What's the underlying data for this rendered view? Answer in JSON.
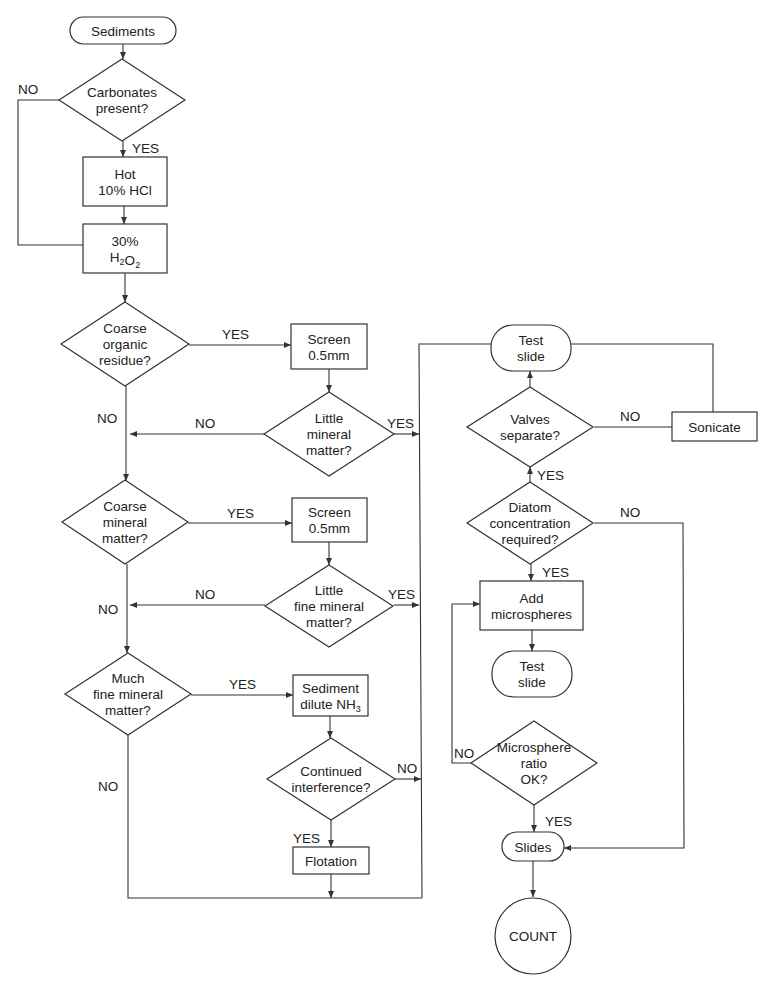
{
  "colors": {
    "line": "#333333",
    "text": "#222222",
    "background": "#ffffff"
  },
  "nodes": [
    {
      "id": "sediments",
      "type": "terminal",
      "lines": [
        "Sediments"
      ],
      "x": 70,
      "y": 17,
      "w": 106,
      "h": 27
    },
    {
      "id": "carbonates",
      "type": "decision",
      "lines": [
        "Carbonates",
        "present?"
      ],
      "cx": 122,
      "cy": 100,
      "hw": 63,
      "hh": 41
    },
    {
      "id": "hot-hcl",
      "type": "process",
      "lines": [
        "Hot",
        "10% HCl"
      ],
      "x": 83,
      "y": 157,
      "w": 84,
      "h": 49
    },
    {
      "id": "h2o2",
      "type": "process",
      "lines": [
        "30%",
        "H2O2"
      ],
      "x": 83,
      "y": 224,
      "w": 84,
      "h": 49
    },
    {
      "id": "coarse-organic",
      "type": "decision",
      "lines": [
        "Coarse",
        "organic",
        "residue?"
      ],
      "cx": 125,
      "cy": 344,
      "hw": 64,
      "hh": 42
    },
    {
      "id": "screen-1",
      "type": "process",
      "lines": [
        "Screen",
        "0.5mm"
      ],
      "x": 291,
      "y": 324,
      "w": 76,
      "h": 45
    },
    {
      "id": "little-mineral",
      "type": "decision",
      "lines": [
        "Little",
        "mineral",
        "matter?"
      ],
      "cx": 329,
      "cy": 434,
      "hw": 65,
      "hh": 42
    },
    {
      "id": "coarse-mineral",
      "type": "decision",
      "lines": [
        "Coarse",
        "mineral",
        "matter?"
      ],
      "cx": 125,
      "cy": 522,
      "hw": 63,
      "hh": 42
    },
    {
      "id": "screen-2",
      "type": "process",
      "lines": [
        "Screen",
        "0.5mm"
      ],
      "x": 292,
      "y": 498,
      "w": 75,
      "h": 44
    },
    {
      "id": "little-fine-mineral",
      "type": "decision",
      "lines": [
        "Little",
        "fine mineral",
        "matter?"
      ],
      "cx": 329,
      "cy": 606,
      "hw": 64,
      "hh": 41
    },
    {
      "id": "much-fine-mineral",
      "type": "decision",
      "lines": [
        "Much",
        "fine mineral",
        "matter?"
      ],
      "cx": 128,
      "cy": 694,
      "hw": 63,
      "hh": 41
    },
    {
      "id": "sediment-nh3",
      "type": "process",
      "lines": [
        "Sediment",
        "dilute NH3"
      ],
      "x": 293,
      "y": 675,
      "w": 75,
      "h": 41
    },
    {
      "id": "continued-interference",
      "type": "decision",
      "lines": [
        "Continued",
        "interference?"
      ],
      "cx": 331,
      "cy": 779,
      "hw": 64,
      "hh": 41
    },
    {
      "id": "flotation",
      "type": "process",
      "lines": [
        "Flotation"
      ],
      "x": 293,
      "y": 847,
      "w": 76,
      "h": 27
    },
    {
      "id": "test-slide-1",
      "type": "terminal",
      "lines": [
        "Test",
        "slide"
      ],
      "x": 491,
      "y": 325,
      "w": 80,
      "h": 46
    },
    {
      "id": "valves-separate",
      "type": "decision",
      "lines": [
        "Valves",
        "separate?"
      ],
      "cx": 530,
      "cy": 427,
      "hw": 63,
      "hh": 40
    },
    {
      "id": "sonicate",
      "type": "process",
      "lines": [
        "Sonicate"
      ],
      "x": 672,
      "y": 412,
      "w": 85,
      "h": 29
    },
    {
      "id": "diatom-concentration",
      "type": "decision",
      "lines": [
        "Diatom",
        "concentration",
        "required?"
      ],
      "cx": 530,
      "cy": 523,
      "hw": 63,
      "hh": 41
    },
    {
      "id": "add-microspheres",
      "type": "process",
      "lines": [
        "Add",
        "microspheres"
      ],
      "x": 480,
      "y": 581,
      "w": 103,
      "h": 49
    },
    {
      "id": "test-slide-2",
      "type": "terminal",
      "lines": [
        "Test",
        "slide"
      ],
      "x": 492,
      "y": 651,
      "w": 80,
      "h": 46
    },
    {
      "id": "microsphere-ratio",
      "type": "decision",
      "lines": [
        "Microsphere",
        "ratio",
        "OK?"
      ],
      "cx": 534,
      "cy": 763,
      "hw": 63,
      "hh": 42
    },
    {
      "id": "slides",
      "type": "terminal",
      "lines": [
        "Slides"
      ],
      "x": 502,
      "y": 832,
      "w": 62,
      "h": 29
    },
    {
      "id": "count",
      "type": "connector",
      "lines": [
        "COUNT"
      ],
      "cx": 533,
      "cy": 936,
      "r": 38
    }
  ],
  "edges": [
    {
      "from": "sediments",
      "to": "carbonates",
      "points": [
        [
          123,
          44
        ],
        [
          123,
          59
        ]
      ],
      "arrow": true
    },
    {
      "from": "carbonates",
      "to": "hot-hcl",
      "label": "YES",
      "points": [
        [
          123,
          141
        ],
        [
          123,
          157
        ]
      ],
      "arrow": true,
      "lx": 132,
      "ly": 153
    },
    {
      "from": "carbonates",
      "to": "h2o2",
      "label": "NO",
      "points": [
        [
          59,
          100
        ],
        [
          18,
          100
        ],
        [
          18,
          245
        ],
        [
          83,
          245
        ]
      ],
      "arrow": false,
      "lx": 18,
      "ly": 94
    },
    {
      "from": "hot-hcl",
      "to": "h2o2",
      "points": [
        [
          124,
          206
        ],
        [
          124,
          224
        ]
      ],
      "arrow": true
    },
    {
      "from": "h2o2",
      "to": "coarse-organic",
      "points": [
        [
          125,
          273
        ],
        [
          125,
          302
        ]
      ],
      "arrow": true
    },
    {
      "from": "coarse-organic",
      "to": "screen-1",
      "label": "YES",
      "points": [
        [
          189,
          345
        ],
        [
          291,
          345
        ]
      ],
      "arrow": true,
      "lx": 222,
      "ly": 339
    },
    {
      "from": "screen-1",
      "to": "little-mineral",
      "points": [
        [
          329,
          369
        ],
        [
          329,
          392
        ]
      ],
      "arrow": true
    },
    {
      "from": "little-mineral",
      "to": "coarse-organic-trunk",
      "label": "NO",
      "points": [
        [
          264,
          434
        ],
        [
          130,
          434
        ]
      ],
      "arrow": true,
      "lx": 195,
      "ly": 428
    },
    {
      "from": "coarse-organic",
      "to": "coarse-mineral",
      "label": "NO",
      "points": [
        [
          126,
          386
        ],
        [
          126,
          481
        ]
      ],
      "arrow": true,
      "lx": 97,
      "ly": 423
    },
    {
      "from": "little-mineral",
      "to": "trunk",
      "label": "YES",
      "points": [
        [
          394,
          434
        ],
        [
          419,
          434
        ]
      ],
      "arrow": true,
      "lx": 387,
      "ly": 428
    },
    {
      "from": "coarse-mineral",
      "to": "screen-2",
      "label": "YES",
      "points": [
        [
          188,
          523
        ],
        [
          292,
          523
        ]
      ],
      "arrow": true,
      "lx": 227,
      "ly": 518
    },
    {
      "from": "screen-2",
      "to": "little-fine-mineral",
      "points": [
        [
          329,
          542
        ],
        [
          329,
          565
        ]
      ],
      "arrow": true
    },
    {
      "from": "little-fine-mineral",
      "to": "coarse-mineral-trunk",
      "label": "NO",
      "points": [
        [
          265,
          605
        ],
        [
          130,
          605
        ]
      ],
      "arrow": true,
      "lx": 195,
      "ly": 599
    },
    {
      "from": "coarse-mineral",
      "to": "much-fine-mineral",
      "label": "NO",
      "points": [
        [
          127,
          564
        ],
        [
          127,
          653
        ]
      ],
      "arrow": true,
      "lx": 98,
      "ly": 614
    },
    {
      "from": "little-fine-mineral",
      "to": "trunk",
      "label": "YES",
      "points": [
        [
          394,
          605
        ],
        [
          419,
          605
        ]
      ],
      "arrow": true,
      "lx": 388,
      "ly": 599
    },
    {
      "from": "much-fine-mineral",
      "to": "sediment-nh3",
      "label": "YES",
      "points": [
        [
          191,
          695
        ],
        [
          293,
          695
        ]
      ],
      "arrow": true,
      "lx": 229,
      "ly": 689
    },
    {
      "from": "sediment-nh3",
      "to": "continued-interference",
      "points": [
        [
          330,
          716
        ],
        [
          330,
          738
        ]
      ],
      "arrow": true
    },
    {
      "from": "continued-interference",
      "to": "trunk",
      "label": "NO",
      "points": [
        [
          395,
          779
        ],
        [
          421,
          779
        ]
      ],
      "arrow": true,
      "lx": 397,
      "ly": 773
    },
    {
      "from": "continued-interference",
      "to": "flotation",
      "label": "YES",
      "points": [
        [
          331,
          820
        ],
        [
          331,
          847
        ]
      ],
      "arrow": true,
      "lx": 293,
      "ly": 843
    },
    {
      "from": "much-fine-mineral",
      "to": "bottom-line",
      "label": "NO",
      "points": [
        [
          128,
          735
        ],
        [
          128,
          898
        ],
        [
          422,
          898
        ]
      ],
      "arrow": false,
      "lx": 98,
      "ly": 791
    },
    {
      "from": "flotation",
      "to": "bottom-line",
      "points": [
        [
          331,
          874
        ],
        [
          331,
          898
        ]
      ],
      "arrow": true
    },
    {
      "from": "trunk",
      "to": "test-slide-1",
      "points": [
        [
          422,
          898
        ],
        [
          419,
          344
        ],
        [
          491,
          344
        ]
      ],
      "arrow": false
    },
    {
      "from": "valves-separate",
      "to": "test-slide-1",
      "points": [
        [
          530,
          387
        ],
        [
          530,
          371
        ]
      ],
      "arrow": true
    },
    {
      "from": "valves-separate",
      "to": "sonicate",
      "label": "NO",
      "points": [
        [
          594,
          427
        ],
        [
          672,
          427
        ]
      ],
      "arrow": false,
      "lx": 620,
      "ly": 421
    },
    {
      "from": "sonicate",
      "to": "test-slide-1",
      "points": [
        [
          713,
          412
        ],
        [
          713,
          344
        ],
        [
          571,
          344
        ]
      ],
      "arrow": false
    },
    {
      "from": "diatom-concentration",
      "to": "valves-separate",
      "label": "YES",
      "points": [
        [
          530,
          482
        ],
        [
          530,
          467
        ]
      ],
      "arrow": true,
      "lx": 537,
      "ly": 480
    },
    {
      "from": "diatom-concentration",
      "to": "slides",
      "label": "NO",
      "points": [
        [
          594,
          523
        ],
        [
          683,
          523
        ],
        [
          684,
          848
        ],
        [
          564,
          848
        ]
      ],
      "arrow": true,
      "lx": 620,
      "ly": 517
    },
    {
      "from": "diatom-concentration",
      "to": "add-microspheres",
      "label": "YES",
      "points": [
        [
          531,
          564
        ],
        [
          531,
          581
        ]
      ],
      "arrow": true,
      "lx": 542,
      "ly": 577
    },
    {
      "from": "add-microspheres",
      "to": "test-slide-2",
      "points": [
        [
          532,
          630
        ],
        [
          532,
          651
        ]
      ],
      "arrow": true
    },
    {
      "from": "microsphere-ratio",
      "to": "add-microspheres",
      "label": "NO",
      "points": [
        [
          471,
          763
        ],
        [
          452,
          763
        ],
        [
          452,
          604
        ],
        [
          480,
          604
        ]
      ],
      "arrow": true,
      "lx": 454,
      "ly": 758
    },
    {
      "from": "microsphere-ratio",
      "to": "slides",
      "label": "YES",
      "points": [
        [
          534,
          805
        ],
        [
          534,
          832
        ]
      ],
      "arrow": true,
      "lx": 545,
      "ly": 826
    },
    {
      "from": "slides",
      "to": "count",
      "points": [
        [
          533,
          861
        ],
        [
          533,
          897
        ]
      ],
      "arrow": true
    }
  ]
}
